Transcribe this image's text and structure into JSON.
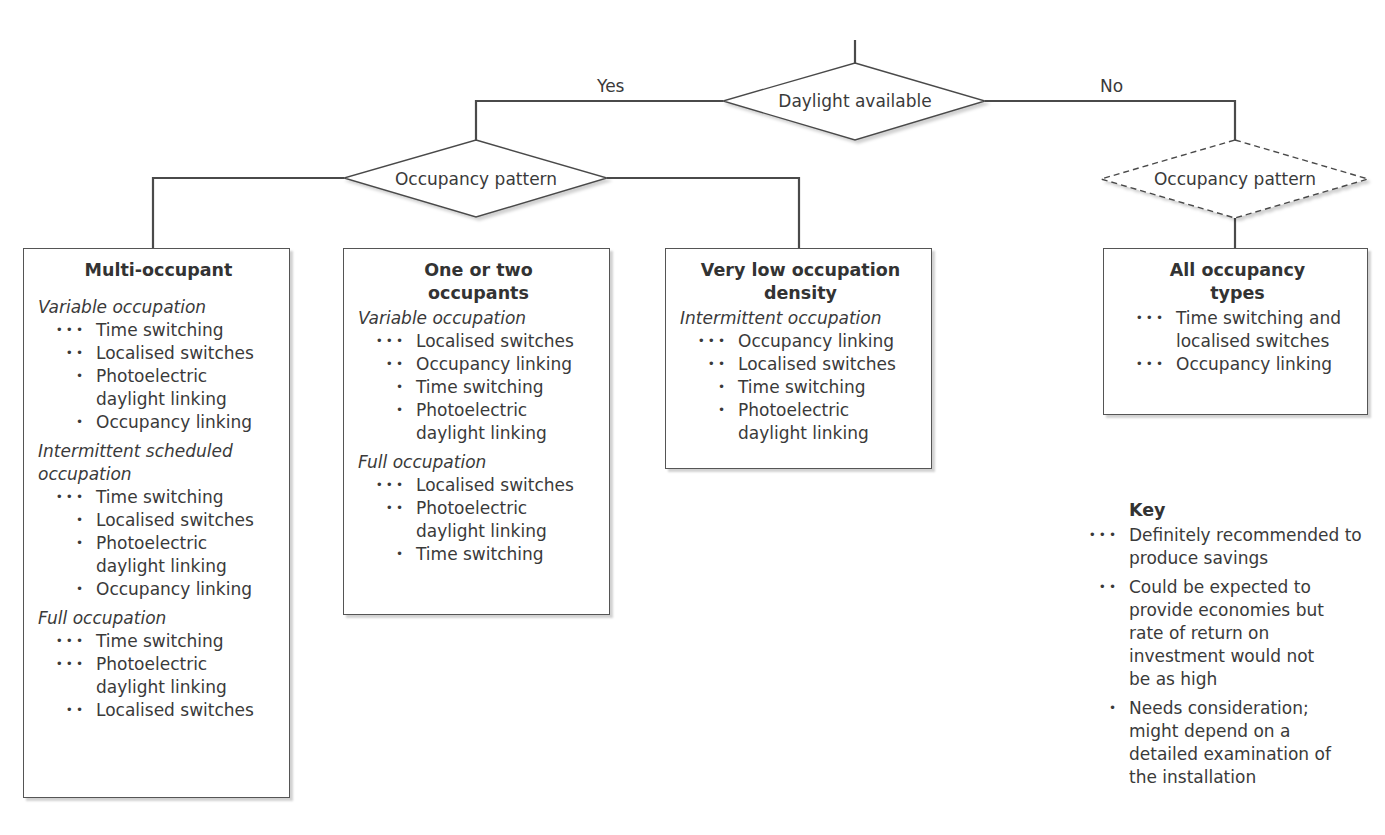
{
  "decisions": {
    "root": {
      "label": "Daylight available"
    },
    "yes_branch": {
      "label": "Yes"
    },
    "no_branch": {
      "label": "No"
    },
    "left_pattern": {
      "label": "Occupancy pattern"
    },
    "right_pattern": {
      "label": "Occupancy pattern",
      "style": "dashed"
    }
  },
  "boxes": [
    {
      "title": "Multi-occupant",
      "sections": [
        {
          "title": "Variable occupation",
          "items": [
            {
              "rating": "•••",
              "text": "Time switching"
            },
            {
              "rating": "••",
              "text": "Localised switches"
            },
            {
              "rating": "•",
              "text": "Photoelectric daylight linking"
            },
            {
              "rating": "•",
              "text": "Occupancy linking"
            }
          ]
        },
        {
          "title": "Intermittent scheduled occupation",
          "items": [
            {
              "rating": "•••",
              "text": "Time switching"
            },
            {
              "rating": "•",
              "text": "Localised switches"
            },
            {
              "rating": "•",
              "text": "Photoelectric daylight linking"
            },
            {
              "rating": "•",
              "text": "Occupancy linking"
            }
          ]
        },
        {
          "title": "Full occupation",
          "items": [
            {
              "rating": "•••",
              "text": "Time switching"
            },
            {
              "rating": "•••",
              "text": "Photoelectric daylight linking"
            },
            {
              "rating": "••",
              "text": "Localised switches"
            }
          ]
        }
      ]
    },
    {
      "title": "One or two occupants",
      "sections": [
        {
          "title": "Variable occupation",
          "items": [
            {
              "rating": "•••",
              "text": "Localised switches"
            },
            {
              "rating": "••",
              "text": "Occupancy linking"
            },
            {
              "rating": "•",
              "text": "Time switching"
            },
            {
              "rating": "•",
              "text": "Photoelectric daylight linking"
            }
          ]
        },
        {
          "title": "Full occupation",
          "items": [
            {
              "rating": "•••",
              "text": "Localised switches"
            },
            {
              "rating": "••",
              "text": "Photoelectric daylight linking"
            },
            {
              "rating": "•",
              "text": "Time switching"
            }
          ]
        }
      ]
    },
    {
      "title": "Very low occupation density",
      "sections": [
        {
          "title": "Intermittent occupation",
          "items": [
            {
              "rating": "•••",
              "text": "Occupancy linking"
            },
            {
              "rating": "••",
              "text": "Localised switches"
            },
            {
              "rating": "•",
              "text": "Time switching"
            },
            {
              "rating": "•",
              "text": "Photoelectric daylight linking"
            }
          ]
        }
      ]
    },
    {
      "title": "All occupancy types",
      "sections": [
        {
          "title": "",
          "items": [
            {
              "rating": "•••",
              "text": "Time switching and localised switches"
            },
            {
              "rating": "•••",
              "text": "Occupancy linking"
            }
          ]
        }
      ]
    }
  ],
  "key": {
    "title": "Key",
    "items": [
      {
        "rating": "•••",
        "text": "Definitely recommended to produce savings"
      },
      {
        "rating": "••",
        "text": "Could be expected to provide economies but rate of return on investment would not be as high"
      },
      {
        "rating": "•",
        "text": "Needs consideration; might depend on a detailed examination of the installation"
      }
    ]
  }
}
